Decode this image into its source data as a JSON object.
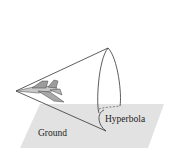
{
  "diagram": {
    "labels": {
      "hyperbola": "Hyperbola",
      "ground": "Ground"
    },
    "elements": [
      "cone",
      "airplane",
      "ground-plane",
      "hyperbola-curve"
    ],
    "colors": {
      "ground_fill": "#e2e2e2",
      "line": "#333333",
      "plane_fill": "#a8a8a8"
    }
  }
}
